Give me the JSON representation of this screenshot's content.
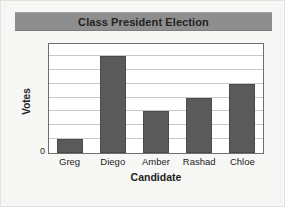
{
  "card": {
    "background_color": "#f7f7f5",
    "border_color": "#e2e2e0"
  },
  "title": {
    "text": "Class President Election",
    "banner_color": "#8e8e8e",
    "text_color": "#232323"
  },
  "axes": {
    "y_title": "Votes",
    "x_title": "Candidate",
    "y_tick_labels": [
      "0"
    ]
  },
  "chart_data": {
    "type": "bar",
    "title": "Class President Election",
    "xlabel": "Candidate",
    "ylabel": "Votes",
    "categories": [
      "Greg",
      "Diego",
      "Amber",
      "Rashad",
      "Chloe"
    ],
    "values": [
      1,
      7,
      3,
      4,
      5
    ],
    "ylim": [
      0,
      8
    ],
    "y_tick_labels_shown": [
      "0"
    ],
    "gridlines": 7,
    "grid": true,
    "legend": "none",
    "bar_color": "#5a5a5a",
    "bar_border_color": "#4a4a4a",
    "gridline_color": "#c8c8c8",
    "plot_background": "#ffffff",
    "plot_border_color": "#6f6f6f"
  }
}
